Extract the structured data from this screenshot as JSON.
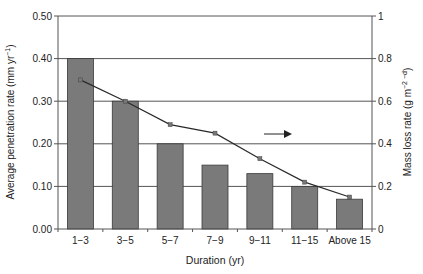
{
  "chart_data": {
    "type": "bar",
    "title": "",
    "xlabel": "Duration (yr)",
    "ylabel": "Average penetration rate (mm yr⁻¹)",
    "y2label": "Mass loss rate (g m⁻² ⁻ᵈ)",
    "categories": [
      "1−3",
      "3−5",
      "5−7",
      "7−9",
      "9−11",
      "11−15",
      "Above 15"
    ],
    "series": [
      {
        "name": "Average penetration rate",
        "type": "bar",
        "axis": "left",
        "values": [
          0.4,
          0.3,
          0.2,
          0.15,
          0.13,
          0.1,
          0.07
        ]
      },
      {
        "name": "Mass loss rate",
        "type": "line",
        "axis": "right",
        "values": [
          0.7,
          0.6,
          0.49,
          0.45,
          0.33,
          0.22,
          0.15
        ]
      }
    ],
    "ylim": [
      0,
      0.5
    ],
    "y2lim": [
      0,
      1
    ],
    "yticks": [
      "0.00",
      "0.10",
      "0.20",
      "0.30",
      "0.40",
      "0.50"
    ],
    "y2ticks": [
      "0",
      "0.2",
      "0.4",
      "0.6",
      "0.8",
      "1"
    ],
    "grid": true,
    "legend": null,
    "annotations": [
      {
        "type": "arrow",
        "direction": "right",
        "meaning": "line refers to right axis"
      }
    ],
    "colors": {
      "bar": "#7a7a7a",
      "bar_edge": "#3a3a3a",
      "line": "#2a2a2a",
      "grid": "#555555"
    }
  }
}
